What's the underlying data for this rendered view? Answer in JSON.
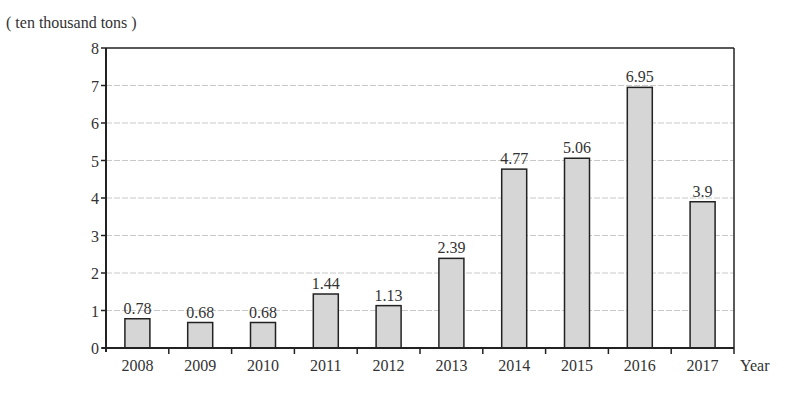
{
  "chart_data": {
    "type": "bar",
    "title": "",
    "unit_label": "( ten thousand tons )",
    "xlabel": "Year",
    "ylabel": "( ten thousand tons )",
    "categories": [
      "2008",
      "2009",
      "2010",
      "2011",
      "2012",
      "2013",
      "2014",
      "2015",
      "2016",
      "2017"
    ],
    "values": [
      0.78,
      0.68,
      0.68,
      1.44,
      1.13,
      2.39,
      4.77,
      5.06,
      6.95,
      3.9
    ],
    "value_labels": [
      "0.78",
      "0.68",
      "0.68",
      "1.44",
      "1.13",
      "2.39",
      "4.77",
      "5.06",
      "6.95",
      "3.9"
    ],
    "ylim": [
      0,
      8
    ],
    "yticks": [
      0,
      1,
      2,
      3,
      4,
      5,
      6,
      7,
      8
    ],
    "grid": true,
    "legend": null,
    "colors": {
      "bar_fill": "#d6d6d6",
      "bar_stroke": "#222222",
      "grid": "#c8c8c8",
      "axis": "#222222"
    }
  }
}
